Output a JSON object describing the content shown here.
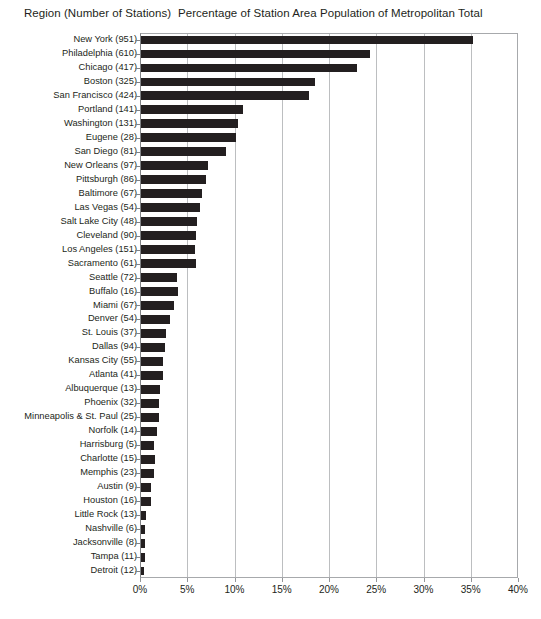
{
  "header": {
    "row_label_header": "Region (Number of Stations)",
    "title": "Percentage of Station Area Population of Metropolitan Total"
  },
  "axis": {
    "ticks": [
      "0%",
      "5%",
      "10%",
      "15%",
      "20%",
      "25%",
      "30%",
      "35%",
      "40%"
    ]
  },
  "colors": {
    "bar": "#231f20",
    "gridline": "#bcbec0",
    "axis": "#808285",
    "text": "#231f20",
    "background": "#ffffff"
  },
  "chart_data": {
    "type": "bar",
    "orientation": "horizontal",
    "title": "Percentage of Station Area Population of Metropolitan Total",
    "xlabel": "Percentage of Station Area Population of Metropolitan Total",
    "ylabel": "Region (Number of Stations)",
    "xlim": [
      0,
      40
    ],
    "xticks": [
      0,
      5,
      10,
      15,
      20,
      25,
      30,
      35,
      40
    ],
    "xtick_labels": [
      "0%",
      "5%",
      "10%",
      "15%",
      "20%",
      "25%",
      "30%",
      "35%",
      "40%"
    ],
    "grid": true,
    "legend": false,
    "unit": "%",
    "categories": [
      "New York (951)",
      "Philadelphia (610)",
      "Chicago (417)",
      "Boston (325)",
      "San Francisco (424)",
      "Portland (141)",
      "Washington (131)",
      "Eugene (28)",
      "San Diego (81)",
      "New Orleans (97)",
      "Pittsburgh (86)",
      "Baltimore (67)",
      "Las Vegas (54)",
      "Salt Lake City (48)",
      "Cleveland (90)",
      "Los Angeles (151)",
      "Sacramento (61)",
      "Seattle (72)",
      "Buffalo (16)",
      "Miami (67)",
      "Denver (54)",
      "St. Louis (37)",
      "Dallas (94)",
      "Kansas City (55)",
      "Atlanta (41)",
      "Albuquerque (13)",
      "Phoenix (32)",
      "Minneapolis & St. Paul (25)",
      "Norfolk (14)",
      "Harrisburg (5)",
      "Charlotte (15)",
      "Memphis (23)",
      "Austin (9)",
      "Houston (16)",
      "Little Rock (13)",
      "Nashville (6)",
      "Jacksonville (8)",
      "Tampa (11)",
      "Detroit (12)"
    ],
    "values": [
      35.1,
      24.2,
      22.9,
      18.4,
      17.8,
      10.8,
      10.3,
      10.0,
      9.0,
      7.1,
      6.9,
      6.5,
      6.2,
      5.9,
      5.8,
      5.7,
      5.8,
      3.8,
      3.9,
      3.5,
      3.1,
      2.6,
      2.5,
      2.3,
      2.3,
      2.0,
      1.9,
      1.9,
      1.7,
      1.4,
      1.5,
      1.4,
      1.1,
      1.1,
      0.5,
      0.45,
      0.45,
      0.4,
      0.3
    ],
    "station_counts": [
      951,
      610,
      417,
      325,
      424,
      141,
      131,
      28,
      81,
      97,
      86,
      67,
      54,
      48,
      90,
      151,
      61,
      72,
      16,
      67,
      54,
      37,
      94,
      55,
      41,
      13,
      32,
      25,
      14,
      5,
      15,
      23,
      9,
      16,
      13,
      6,
      8,
      11,
      12
    ],
    "region_names": [
      "New York",
      "Philadelphia",
      "Chicago",
      "Boston",
      "San Francisco",
      "Portland",
      "Washington",
      "Eugene",
      "San Diego",
      "New Orleans",
      "Pittsburgh",
      "Baltimore",
      "Las Vegas",
      "Salt Lake City",
      "Cleveland",
      "Los Angeles",
      "Sacramento",
      "Seattle",
      "Buffalo",
      "Miami",
      "Denver",
      "St. Louis",
      "Dallas",
      "Kansas City",
      "Atlanta",
      "Albuquerque",
      "Phoenix",
      "Minneapolis & St. Paul",
      "Norfolk",
      "Harrisburg",
      "Charlotte",
      "Memphis",
      "Austin",
      "Houston",
      "Little Rock",
      "Nashville",
      "Jacksonville",
      "Tampa",
      "Detroit"
    ]
  }
}
